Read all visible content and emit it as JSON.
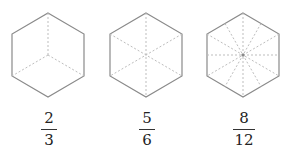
{
  "figures": [
    {
      "label": "hexagon-divided-into-3",
      "numerator": "2",
      "denominator": "3",
      "parts": 3
    },
    {
      "label": "hexagon-divided-into-6",
      "numerator": "5",
      "denominator": "6",
      "parts": 6
    },
    {
      "label": "hexagon-divided-into-12",
      "numerator": "8",
      "denominator": "12",
      "parts": 12
    }
  ],
  "colors": {
    "outline": "#8a8a8a",
    "dashed": "#bdbdbd",
    "text": "#222222"
  }
}
